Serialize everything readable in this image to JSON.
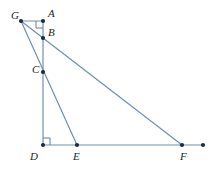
{
  "figure": {
    "kind": "geometry-diagram",
    "width": 218,
    "height": 170,
    "background_color": "#ffffff",
    "stroke_color": "#6f8fb4",
    "stroke_color_dark": "#5d7ea6",
    "point_color": "#1d2b3a",
    "label_color": "#232323",
    "stroke_width": 1.2
  },
  "points": {
    "G": {
      "label": "G",
      "x": 21,
      "y": 21,
      "label_x": 11,
      "label_y": 19,
      "dot": true
    },
    "A": {
      "label": "A",
      "x": 43,
      "y": 21,
      "label_x": 48,
      "label_y": 17,
      "dot": true
    },
    "B": {
      "label": "B",
      "x": 43,
      "y": 38,
      "label_x": 48,
      "label_y": 36,
      "dot": true
    },
    "C": {
      "label": "C",
      "x": 43,
      "y": 72,
      "label_x": 32,
      "label_y": 73,
      "dot": true
    },
    "D": {
      "label": "D",
      "x": 43,
      "y": 145,
      "label_x": 30,
      "label_y": 160,
      "dot": true
    },
    "E": {
      "label": "E",
      "x": 77,
      "y": 145,
      "label_x": 73,
      "label_y": 160,
      "dot": true
    },
    "F": {
      "label": "F",
      "x": 182,
      "y": 145,
      "label_x": 180,
      "label_y": 160,
      "dot": true
    },
    "H": {
      "label": "",
      "x": 203,
      "y": 145,
      "label_x": 0,
      "label_y": 0,
      "dot": true
    }
  },
  "segments": [
    {
      "name": "segment-G-A",
      "from": "G",
      "to": "A"
    },
    {
      "name": "segment-G-B",
      "from": "G",
      "to": "B"
    },
    {
      "name": "segment-G-E",
      "from": "G",
      "to": "E"
    },
    {
      "name": "segment-A-D",
      "from": "A",
      "to": "D"
    },
    {
      "name": "segment-B-F",
      "from": "B",
      "to": "F"
    },
    {
      "name": "segment-D-H",
      "from": "D",
      "to": "H"
    }
  ],
  "right_angles": [
    {
      "name": "right-angle-at-A",
      "vertex": "A",
      "dx": -1,
      "dy": 1,
      "size": 7
    },
    {
      "name": "right-angle-at-D",
      "vertex": "D",
      "dx": 1,
      "dy": -1,
      "size": 7
    }
  ],
  "accessibility": {
    "caption": "Geometric figure with vertices G, A, B, C, D, E, F; right angles marked at A and at D."
  }
}
